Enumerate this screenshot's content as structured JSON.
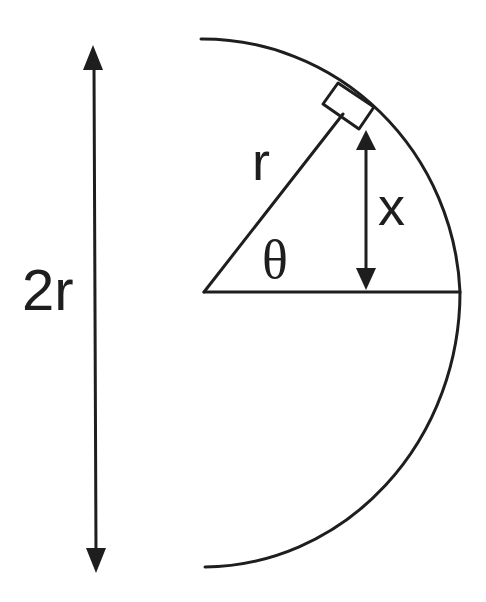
{
  "diagram": {
    "type": "geometry",
    "labels": {
      "radius": "r",
      "height": "x",
      "angle": "θ",
      "diameter": "2r"
    },
    "colors": {
      "line": "#1e1e1e",
      "background": "#ffffff"
    }
  }
}
